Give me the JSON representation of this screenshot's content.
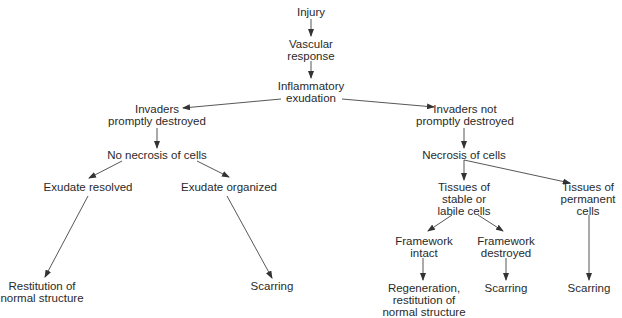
{
  "diagram": {
    "nodes": {
      "injury": "Injury",
      "vascular": "Vascular\nresponse",
      "inflammatory": "Inflammatory\nexudation",
      "invaders_destroyed": "Invaders\npromptly destroyed",
      "invaders_not_destroyed": "Invaders not\npromptly destroyed",
      "no_necrosis": "No necrosis of cells",
      "necrosis": "Necrosis of cells",
      "exudate_resolved": "Exudate resolved",
      "exudate_organized": "Exudate organized",
      "restitution": "Restitution of\nnormal structure",
      "scarring_left": "Scarring",
      "tissues_stable": "Tissues of\nstable or\nlabile cells",
      "tissues_permanent": "Tissues of\npermanent\ncells",
      "framework_intact": "Framework\nintact",
      "framework_destroyed": "Framework\ndestroyed",
      "regeneration": "Regeneration,\nrestitution of\nnormal structure",
      "scarring_mid": "Scarring",
      "scarring_right": "Scarring"
    },
    "edges": [
      [
        "injury",
        "vascular"
      ],
      [
        "vascular",
        "inflammatory"
      ],
      [
        "inflammatory",
        "invaders_destroyed"
      ],
      [
        "inflammatory",
        "invaders_not_destroyed"
      ],
      [
        "invaders_destroyed",
        "no_necrosis"
      ],
      [
        "no_necrosis",
        "exudate_resolved"
      ],
      [
        "no_necrosis",
        "exudate_organized"
      ],
      [
        "exudate_resolved",
        "restitution"
      ],
      [
        "exudate_organized",
        "scarring_left"
      ],
      [
        "invaders_not_destroyed",
        "necrosis"
      ],
      [
        "necrosis",
        "tissues_stable"
      ],
      [
        "necrosis",
        "tissues_permanent"
      ],
      [
        "tissues_stable",
        "framework_intact"
      ],
      [
        "tissues_stable",
        "framework_destroyed"
      ],
      [
        "framework_intact",
        "regeneration"
      ],
      [
        "framework_destroyed",
        "scarring_mid"
      ],
      [
        "tissues_permanent",
        "scarring_right"
      ]
    ],
    "colors": {
      "line": "#333333",
      "text": "#2a2a2a",
      "background": "#ffffff"
    }
  }
}
